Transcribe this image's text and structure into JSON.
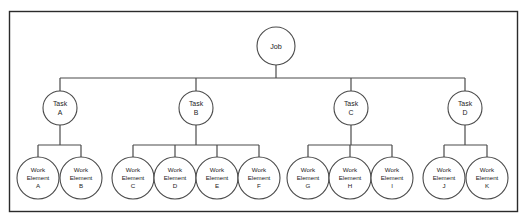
{
  "diagram": {
    "type": "work-breakdown-structure-tree",
    "frame": {
      "label": "diagram-border",
      "stroke_color": "#2b2b2b",
      "background_color": "#ffffff"
    },
    "colors": {
      "node_stroke": "#4a4a4a",
      "connector_stroke": "#4a4a4a",
      "node_fill": "#ffffff",
      "text": "#1c1c1c",
      "frame": "#2b2b2b"
    },
    "root": {
      "id": "job",
      "label": "Job",
      "line1": "Job",
      "cx": 276,
      "cy": 46,
      "r": 19
    },
    "level_labels": {
      "root_level": "Job",
      "middle_level": "Task",
      "leaf_level": "Work Element"
    },
    "tasks": [
      {
        "id": "task-a",
        "line1": "Task",
        "line2": "A",
        "cx": 60,
        "cy": 108,
        "r": 17
      },
      {
        "id": "task-b",
        "line1": "Task",
        "line2": "B",
        "cx": 196,
        "cy": 108,
        "r": 17
      },
      {
        "id": "task-c",
        "line1": "Task",
        "line2": "C",
        "cx": 351,
        "cy": 108,
        "r": 17
      },
      {
        "id": "task-d",
        "line1": "Task",
        "line2": "D",
        "cx": 465,
        "cy": 108,
        "r": 17
      }
    ],
    "work_elements": [
      {
        "id": "we-a",
        "line1": "Work",
        "line2": "Element",
        "line3": "A",
        "cx": 38,
        "cy": 178,
        "r": 21,
        "parent": "task-a"
      },
      {
        "id": "we-b",
        "line1": "Work",
        "line2": "Element",
        "line3": "B",
        "cx": 81,
        "cy": 178,
        "r": 21,
        "parent": "task-a"
      },
      {
        "id": "we-c",
        "line1": "Work",
        "line2": "Element",
        "line3": "C",
        "cx": 133,
        "cy": 178,
        "r": 21,
        "parent": "task-b"
      },
      {
        "id": "we-d",
        "line1": "Work",
        "line2": "Element",
        "line3": "D",
        "cx": 175,
        "cy": 178,
        "r": 21,
        "parent": "task-b"
      },
      {
        "id": "we-e",
        "line1": "Work",
        "line2": "Element",
        "line3": "E",
        "cx": 217,
        "cy": 178,
        "r": 21,
        "parent": "task-b"
      },
      {
        "id": "we-f",
        "line1": "Work",
        "line2": "Element",
        "line3": "F",
        "cx": 259,
        "cy": 178,
        "r": 21,
        "parent": "task-b"
      },
      {
        "id": "we-g",
        "line1": "Work",
        "line2": "Element",
        "line3": "G",
        "cx": 308,
        "cy": 178,
        "r": 21,
        "parent": "task-c"
      },
      {
        "id": "we-h",
        "line1": "Work",
        "line2": "Element",
        "line3": "H",
        "cx": 350,
        "cy": 178,
        "r": 21,
        "parent": "task-c"
      },
      {
        "id": "we-i",
        "line1": "Work",
        "line2": "Element",
        "line3": "I",
        "cx": 392,
        "cy": 178,
        "r": 21,
        "parent": "task-c"
      },
      {
        "id": "we-j",
        "line1": "Work",
        "line2": "Element",
        "line3": "J",
        "cx": 444,
        "cy": 178,
        "r": 21,
        "parent": "task-d"
      },
      {
        "id": "we-k",
        "line1": "Work",
        "line2": "Element",
        "line3": "K",
        "cx": 487,
        "cy": 178,
        "r": 21,
        "parent": "task-d"
      }
    ]
  }
}
